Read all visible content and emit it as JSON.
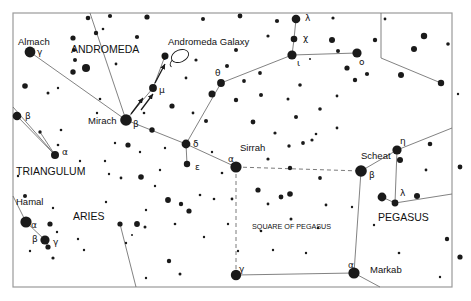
{
  "chart": {
    "type": "star-chart",
    "background_color": "#ffffff",
    "ink_color": "#1a1a1a",
    "line_color": "#6b6b6b",
    "border": {
      "x": 13,
      "y": 13,
      "width": 439,
      "height": 274,
      "color": "#9a9a9a"
    }
  },
  "constellation_names": [
    {
      "id": "andromeda",
      "text": "ANDROMEDA",
      "x": 71,
      "y": 53,
      "size": 10.5,
      "anchor": "start"
    },
    {
      "id": "triangulum",
      "text": "TRIANGULUM",
      "x": 16,
      "y": 175,
      "size": 10.5,
      "anchor": "start"
    },
    {
      "id": "aries",
      "text": "ARIES",
      "x": 73,
      "y": 220,
      "size": 10.5,
      "anchor": "start"
    },
    {
      "id": "pegasus",
      "text": "PEGASUS",
      "x": 378,
      "y": 221,
      "size": 10.5,
      "anchor": "start"
    },
    {
      "id": "square-of-pegasus",
      "text": "SQUARE OF PEGASUS",
      "x": 252,
      "y": 229,
      "size": 7.2,
      "anchor": "start"
    }
  ],
  "object_labels": [
    {
      "id": "andromeda-galaxy",
      "text": "Andromeda Galaxy",
      "x": 168,
      "y": 45,
      "size": 9.5,
      "anchor": "start"
    }
  ],
  "star_names": [
    {
      "id": "almach",
      "text": "Almach",
      "x": 18,
      "y": 45,
      "size": 9.5,
      "anchor": "start"
    },
    {
      "id": "mirach",
      "text": "Mirach",
      "x": 88,
      "y": 124,
      "size": 9.5,
      "anchor": "start"
    },
    {
      "id": "sirrah",
      "text": "Sirrah",
      "x": 240,
      "y": 151,
      "size": 9.5,
      "anchor": "start"
    },
    {
      "id": "scheat",
      "text": "Scheat",
      "x": 361,
      "y": 159,
      "size": 9.5,
      "anchor": "start"
    },
    {
      "id": "hamal",
      "text": "Hamal",
      "x": 16,
      "y": 205,
      "size": 9.5,
      "anchor": "start"
    },
    {
      "id": "markab",
      "text": "Markab",
      "x": 370,
      "y": 273,
      "size": 9.5,
      "anchor": "start"
    }
  ],
  "greek_labels": [
    {
      "id": "gamma-andromedae",
      "text": "γ",
      "x": 37,
      "y": 55,
      "size": 9
    },
    {
      "id": "beta-andromedae",
      "text": "β",
      "x": 133,
      "y": 127,
      "size": 9
    },
    {
      "id": "mu-andromedae",
      "text": "μ",
      "x": 159,
      "y": 93,
      "size": 9
    },
    {
      "id": "nu-andromedae",
      "text": "ν",
      "x": 162,
      "y": 60,
      "size": 9
    },
    {
      "id": "theta-andromedae",
      "text": "θ",
      "x": 215,
      "y": 76,
      "size": 9
    },
    {
      "id": "delta-andromedae",
      "text": "δ",
      "x": 193,
      "y": 147,
      "size": 9
    },
    {
      "id": "epsilon-andromedae",
      "text": "ε",
      "x": 195,
      "y": 170,
      "size": 9
    },
    {
      "id": "alpha-andromedae-sirrah",
      "text": "α",
      "x": 228,
      "y": 162,
      "size": 9
    },
    {
      "id": "lambda-andromedae",
      "text": "λ",
      "x": 305,
      "y": 21,
      "size": 9
    },
    {
      "id": "chi-andromedae",
      "text": "χ",
      "x": 303,
      "y": 41,
      "size": 9
    },
    {
      "id": "iota-andromedae",
      "text": "ι",
      "x": 297,
      "y": 66,
      "size": 9
    },
    {
      "id": "omicron-andromedae",
      "text": "ο",
      "x": 359,
      "y": 65,
      "size": 9
    },
    {
      "id": "beta-trianguli",
      "text": "β",
      "x": 25,
      "y": 119,
      "size": 9
    },
    {
      "id": "alpha-trianguli",
      "text": "α",
      "x": 62,
      "y": 155,
      "size": 9
    },
    {
      "id": "alpha-arietis",
      "text": "α",
      "x": 31,
      "y": 228,
      "size": 9
    },
    {
      "id": "beta-arietis",
      "text": "β",
      "x": 32,
      "y": 242,
      "size": 9
    },
    {
      "id": "gamma-arietis",
      "text": "γ",
      "x": 53,
      "y": 245,
      "size": 9
    },
    {
      "id": "beta-pegasi-scheat",
      "text": "β",
      "x": 369,
      "y": 178,
      "size": 9
    },
    {
      "id": "eta-pegasi",
      "text": "η",
      "x": 400,
      "y": 144,
      "size": 9
    },
    {
      "id": "lambda-pegasi",
      "text": "λ",
      "x": 400,
      "y": 196,
      "size": 9
    },
    {
      "id": "gamma-pegasi",
      "text": "γ",
      "x": 239,
      "y": 272,
      "size": 9
    },
    {
      "id": "alpha-pegasi-markab",
      "text": "α",
      "x": 348,
      "y": 268,
      "size": 9
    }
  ],
  "named_stars": [
    {
      "id": "almach",
      "x": 30,
      "y": 52,
      "r": 5.4
    },
    {
      "id": "mirach",
      "x": 126,
      "y": 120,
      "r": 5.8
    },
    {
      "id": "mu-and",
      "x": 153,
      "y": 88,
      "r": 3.9
    },
    {
      "id": "nu-and",
      "x": 165,
      "y": 56,
      "r": 3.5
    },
    {
      "id": "theta-and",
      "x": 221,
      "y": 83,
      "r": 3.9
    },
    {
      "id": "delta-and",
      "x": 186,
      "y": 144,
      "r": 4.4
    },
    {
      "id": "epsilon-and",
      "x": 187,
      "y": 164,
      "r": 3.2
    },
    {
      "id": "sirrah",
      "x": 236,
      "y": 167,
      "r": 5.6
    },
    {
      "id": "lambda-and",
      "x": 296,
      "y": 19,
      "r": 4.3
    },
    {
      "id": "chi-and",
      "x": 294,
      "y": 39,
      "r": 3.3
    },
    {
      "id": "iota-and",
      "x": 292,
      "y": 55,
      "r": 4.6
    },
    {
      "id": "omicron-and",
      "x": 357,
      "y": 53,
      "r": 4.6
    },
    {
      "id": "beta-tri",
      "x": 17,
      "y": 116,
      "r": 4.3
    },
    {
      "id": "alpha-tri",
      "x": 55,
      "y": 155,
      "r": 4.0
    },
    {
      "id": "hamal",
      "x": 26,
      "y": 222,
      "r": 5.6
    },
    {
      "id": "beta-ari",
      "x": 45,
      "y": 240,
      "r": 4.6
    },
    {
      "id": "gamma-ari",
      "x": 48,
      "y": 247,
      "r": 2.6
    },
    {
      "id": "scheat",
      "x": 361,
      "y": 171,
      "r": 5.8
    },
    {
      "id": "markab",
      "x": 354,
      "y": 273,
      "r": 5.6
    },
    {
      "id": "gamma-peg",
      "x": 236,
      "y": 275,
      "r": 5.2
    },
    {
      "id": "eta-peg",
      "x": 397,
      "y": 150,
      "r": 4.6
    },
    {
      "id": "eta-peg-b",
      "x": 400,
      "y": 160,
      "r": 3.0
    },
    {
      "id": "lambda-peg",
      "x": 395,
      "y": 203,
      "r": 3.4
    },
    {
      "id": "mu-peg",
      "x": 382,
      "y": 197,
      "r": 4.4
    }
  ],
  "field_stars": [
    {
      "x": 88,
      "y": 18,
      "r": 2.3
    },
    {
      "x": 110,
      "y": 16,
      "r": 2.1
    },
    {
      "x": 147,
      "y": 17,
      "r": 2.6
    },
    {
      "x": 203,
      "y": 19,
      "r": 2.0
    },
    {
      "x": 240,
      "y": 16,
      "r": 2.4
    },
    {
      "x": 277,
      "y": 21,
      "r": 2.1
    },
    {
      "x": 333,
      "y": 18,
      "r": 1.6
    },
    {
      "x": 385,
      "y": 19,
      "r": 1.4
    },
    {
      "x": 424,
      "y": 36,
      "r": 3.2
    },
    {
      "x": 448,
      "y": 44,
      "r": 1.8
    },
    {
      "x": 103,
      "y": 29,
      "r": 1.3
    },
    {
      "x": 73,
      "y": 38,
      "r": 2.6
    },
    {
      "x": 74,
      "y": 50,
      "r": 2.0
    },
    {
      "x": 75,
      "y": 60,
      "r": 2.0
    },
    {
      "x": 96,
      "y": 33,
      "r": 2.2
    },
    {
      "x": 137,
      "y": 37,
      "r": 2.1
    },
    {
      "x": 268,
      "y": 36,
      "r": 1.6
    },
    {
      "x": 332,
      "y": 40,
      "r": 3.0
    },
    {
      "x": 375,
      "y": 40,
      "r": 2.2
    },
    {
      "x": 414,
      "y": 49,
      "r": 3.0
    },
    {
      "x": 86,
      "y": 68,
      "r": 4.0
    },
    {
      "x": 73,
      "y": 72,
      "r": 2.7
    },
    {
      "x": 116,
      "y": 64,
      "r": 1.4
    },
    {
      "x": 196,
      "y": 60,
      "r": 1.6
    },
    {
      "x": 186,
      "y": 78,
      "r": 1.4
    },
    {
      "x": 212,
      "y": 94,
      "r": 3.5
    },
    {
      "x": 236,
      "y": 50,
      "r": 2.0
    },
    {
      "x": 260,
      "y": 73,
      "r": 1.9
    },
    {
      "x": 310,
      "y": 59,
      "r": 1.0
    },
    {
      "x": 338,
      "y": 51,
      "r": 2.0
    },
    {
      "x": 347,
      "y": 68,
      "r": 2.6
    },
    {
      "x": 355,
      "y": 80,
      "r": 2.2
    },
    {
      "x": 367,
      "y": 74,
      "r": 2.1
    },
    {
      "x": 300,
      "y": 85,
      "r": 1.8
    },
    {
      "x": 244,
      "y": 81,
      "r": 1.9
    },
    {
      "x": 227,
      "y": 66,
      "r": 2.0
    },
    {
      "x": 236,
      "y": 100,
      "r": 2.2
    },
    {
      "x": 401,
      "y": 75,
      "r": 3.0
    },
    {
      "x": 441,
      "y": 83,
      "r": 3.2
    },
    {
      "x": 458,
      "y": 94,
      "r": 1.2
    },
    {
      "x": 25,
      "y": 86,
      "r": 2.8
    },
    {
      "x": 48,
      "y": 93,
      "r": 1.5
    },
    {
      "x": 58,
      "y": 88,
      "r": 1.2
    },
    {
      "x": 100,
      "y": 99,
      "r": 1.3
    },
    {
      "x": 144,
      "y": 113,
      "r": 1.3
    },
    {
      "x": 172,
      "y": 106,
      "r": 2.6
    },
    {
      "x": 193,
      "y": 113,
      "r": 1.4
    },
    {
      "x": 206,
      "y": 121,
      "r": 2.0
    },
    {
      "x": 261,
      "y": 95,
      "r": 2.0
    },
    {
      "x": 288,
      "y": 99,
      "r": 1.5
    },
    {
      "x": 296,
      "y": 117,
      "r": 2.0
    },
    {
      "x": 320,
      "y": 109,
      "r": 1.8
    },
    {
      "x": 253,
      "y": 122,
      "r": 2.4
    },
    {
      "x": 275,
      "y": 133,
      "r": 1.6
    },
    {
      "x": 316,
      "y": 134,
      "r": 1.3
    },
    {
      "x": 337,
      "y": 128,
      "r": 1.4
    },
    {
      "x": 61,
      "y": 130,
      "r": 1.3
    },
    {
      "x": 40,
      "y": 132,
      "r": 1.7
    },
    {
      "x": 58,
      "y": 145,
      "r": 1.3
    },
    {
      "x": 115,
      "y": 143,
      "r": 1.2
    },
    {
      "x": 128,
      "y": 145,
      "r": 2.6
    },
    {
      "x": 140,
      "y": 152,
      "r": 1.2
    },
    {
      "x": 152,
      "y": 130,
      "r": 2.7
    },
    {
      "x": 141,
      "y": 177,
      "r": 2.8
    },
    {
      "x": 121,
      "y": 178,
      "r": 1.4
    },
    {
      "x": 109,
      "y": 174,
      "r": 1.2
    },
    {
      "x": 165,
      "y": 148,
      "r": 1.2
    },
    {
      "x": 168,
      "y": 200,
      "r": 2.9
    },
    {
      "x": 155,
      "y": 186,
      "r": 1.2
    },
    {
      "x": 25,
      "y": 196,
      "r": 2.0
    },
    {
      "x": 18,
      "y": 176,
      "r": 1.2
    },
    {
      "x": 53,
      "y": 208,
      "r": 1.2
    },
    {
      "x": 50,
      "y": 224,
      "r": 2.6
    },
    {
      "x": 57,
      "y": 232,
      "r": 1.2
    },
    {
      "x": 78,
      "y": 239,
      "r": 1.2
    },
    {
      "x": 53,
      "y": 258,
      "r": 1.6
    },
    {
      "x": 30,
      "y": 251,
      "r": 1.2
    },
    {
      "x": 84,
      "y": 250,
      "r": 1.2
    },
    {
      "x": 120,
      "y": 224,
      "r": 2.6
    },
    {
      "x": 106,
      "y": 202,
      "r": 1.2
    },
    {
      "x": 146,
      "y": 210,
      "r": 1.2
    },
    {
      "x": 189,
      "y": 211,
      "r": 2.6
    },
    {
      "x": 181,
      "y": 204,
      "r": 2.2
    },
    {
      "x": 200,
      "y": 195,
      "r": 1.3
    },
    {
      "x": 145,
      "y": 227,
      "r": 1.5
    },
    {
      "x": 137,
      "y": 224,
      "r": 2.9
    },
    {
      "x": 132,
      "y": 235,
      "r": 1.0
    },
    {
      "x": 175,
      "y": 224,
      "r": 1.3
    },
    {
      "x": 126,
      "y": 243,
      "r": 1.2
    },
    {
      "x": 169,
      "y": 261,
      "r": 2.2
    },
    {
      "x": 204,
      "y": 237,
      "r": 1.2
    },
    {
      "x": 228,
      "y": 224,
      "r": 1.2
    },
    {
      "x": 261,
      "y": 231,
      "r": 1.3
    },
    {
      "x": 238,
      "y": 251,
      "r": 1.2
    },
    {
      "x": 180,
      "y": 274,
      "r": 1.5
    },
    {
      "x": 146,
      "y": 278,
      "r": 1.2
    },
    {
      "x": 214,
      "y": 199,
      "r": 1.3
    },
    {
      "x": 258,
      "y": 190,
      "r": 2.6
    },
    {
      "x": 281,
      "y": 197,
      "r": 2.4
    },
    {
      "x": 290,
      "y": 194,
      "r": 2.8
    },
    {
      "x": 268,
      "y": 204,
      "r": 1.4
    },
    {
      "x": 290,
      "y": 168,
      "r": 2.2
    },
    {
      "x": 268,
      "y": 159,
      "r": 1.6
    },
    {
      "x": 289,
      "y": 146,
      "r": 1.7
    },
    {
      "x": 303,
      "y": 143,
      "r": 1.9
    },
    {
      "x": 312,
      "y": 140,
      "r": 1.6
    },
    {
      "x": 320,
      "y": 178,
      "r": 1.9
    },
    {
      "x": 326,
      "y": 205,
      "r": 1.4
    },
    {
      "x": 318,
      "y": 228,
      "r": 1.2
    },
    {
      "x": 306,
      "y": 253,
      "r": 1.2
    },
    {
      "x": 273,
      "y": 250,
      "r": 1.2
    },
    {
      "x": 291,
      "y": 219,
      "r": 1.5
    },
    {
      "x": 232,
      "y": 199,
      "r": 1.4
    },
    {
      "x": 417,
      "y": 196,
      "r": 3.0
    },
    {
      "x": 374,
      "y": 225,
      "r": 1.2
    },
    {
      "x": 426,
      "y": 170,
      "r": 1.4
    },
    {
      "x": 430,
      "y": 144,
      "r": 2.3
    },
    {
      "x": 460,
      "y": 167,
      "r": 2.4
    },
    {
      "x": 447,
      "y": 239,
      "r": 2.2
    },
    {
      "x": 460,
      "y": 257,
      "r": 2.6
    },
    {
      "x": 440,
      "y": 277,
      "r": 1.2
    },
    {
      "x": 399,
      "y": 253,
      "r": 1.3
    },
    {
      "x": 352,
      "y": 207,
      "r": 1.2
    },
    {
      "x": 222,
      "y": 173,
      "r": 1.3
    },
    {
      "x": 337,
      "y": 96,
      "r": 1.4
    },
    {
      "x": 97,
      "y": 113,
      "r": 1.2
    },
    {
      "x": 212,
      "y": 152,
      "r": 1.2
    },
    {
      "x": 160,
      "y": 170,
      "r": 1.2
    },
    {
      "x": 80,
      "y": 161,
      "r": 1.2
    },
    {
      "x": 105,
      "y": 161,
      "r": 1.2
    }
  ],
  "solid_lines": [
    {
      "id": "almach-mirach",
      "points": "30,52 126,120"
    },
    {
      "id": "top-to-mirach",
      "points": "90,13 126,120"
    },
    {
      "id": "mirach-mu",
      "points": "126,120 153,88"
    },
    {
      "id": "mu-nu",
      "points": "153,88 165,56"
    },
    {
      "id": "mirach-delta",
      "points": "126,120 186,144"
    },
    {
      "id": "delta-epsilon",
      "points": "186,144 187,164"
    },
    {
      "id": "delta-theta",
      "points": "186,144 221,83"
    },
    {
      "id": "theta-iota",
      "points": "221,83 292,55"
    },
    {
      "id": "iota-chi",
      "points": "292,55 294,39"
    },
    {
      "id": "chi-lambda",
      "points": "294,39 296,19"
    },
    {
      "id": "iota-omicron",
      "points": "292,55 357,53"
    },
    {
      "id": "delta-sirrah",
      "points": "186,144 236,167"
    },
    {
      "id": "beta-tri-alpha-tri",
      "points": "17,116 55,155"
    },
    {
      "id": "tri-upper-alpha",
      "points": "40,132 55,155"
    },
    {
      "id": "tri-left-alpha",
      "points": "13,107 55,155"
    },
    {
      "id": "hamal-beta-ari",
      "points": "26,222 45,240"
    },
    {
      "id": "hamal-up",
      "points": "26,222 13,196"
    },
    {
      "id": "beta-gamma-ari",
      "points": "45,240 48,247"
    },
    {
      "id": "aries-to-edge",
      "points": "120,224 136,287"
    },
    {
      "id": "scheat-markab",
      "points": "361,171 354,273"
    },
    {
      "id": "gamma-markab",
      "points": "236,275 354,273"
    },
    {
      "id": "scheat-eta",
      "points": "361,171 397,150"
    },
    {
      "id": "eta-top-right",
      "points": "397,150 452,128"
    },
    {
      "id": "eta-mu-peg",
      "points": "397,150 395,203"
    },
    {
      "id": "mu-lambda-peg",
      "points": "382,197 395,203"
    },
    {
      "id": "lambda-right",
      "points": "395,203 452,194"
    },
    {
      "id": "markab-down-right",
      "points": "354,273 380,287"
    },
    {
      "id": "top-right-down",
      "points": "381,13 381,58"
    },
    {
      "id": "right-diagonal",
      "points": "381,58 441,83"
    }
  ],
  "dashed_lines": [
    {
      "id": "sirrah-scheat",
      "points": "236,167 361,171"
    },
    {
      "id": "sirrah-gamma-peg",
      "points": "236,167 236,275"
    }
  ],
  "arrows": [
    {
      "id": "arrow-mirach-to-mu-1",
      "x1": 131,
      "y1": 114,
      "x2": 143,
      "y2": 98
    },
    {
      "id": "arrow-mirach-to-mu-2",
      "x1": 141,
      "y1": 110,
      "x2": 153,
      "y2": 94
    },
    {
      "id": "arrow-mu-to-nu-1",
      "x1": 155,
      "y1": 83,
      "x2": 165,
      "y2": 64
    }
  ],
  "galaxy_symbol": {
    "id": "andromeda-galaxy-glyph",
    "cx": 180,
    "cy": 56,
    "rx": 9,
    "ry": 6,
    "rotation": -22
  }
}
